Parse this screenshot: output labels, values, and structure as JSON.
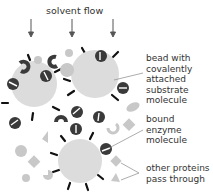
{
  "title": "solvent flow",
  "labels": {
    "bead": [
      "bead with",
      "covalently",
      "attached",
      "substrate",
      "molecule"
    ],
    "enzyme": [
      "bound",
      "enzyme",
      "molecule"
    ],
    "others": [
      "other proteins",
      "pass through"
    ]
  },
  "colors": {
    "bead": "#dcdcdc",
    "enzyme": "#3a3a3a",
    "other_protein": "#c8c8c8",
    "arrow": "#555555",
    "leader_line": "#888888"
  }
}
